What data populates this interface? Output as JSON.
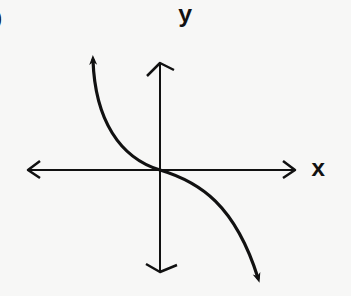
{
  "diagram": {
    "partial_label": ")",
    "axes": {
      "x_label": "x",
      "y_label": "y",
      "origin": [
        160,
        170
      ],
      "x_axis": {
        "from": [
          28,
          170
        ],
        "to": [
          295,
          170
        ],
        "arrows": [
          "left",
          "right"
        ]
      },
      "y_axis": {
        "from": [
          160,
          62
        ],
        "to": [
          160,
          272
        ],
        "arrows": [
          "up",
          "down"
        ]
      }
    },
    "curve": {
      "description": "decreasing cubic-like curve through origin (y = -x^3 shape)",
      "arrows": [
        "upper-left",
        "lower-right"
      ],
      "path": "M 93 60 C 95 120, 120 158, 160 170 C 200 182, 235 205, 258 278"
    },
    "colors": {
      "background": "#f7f7f6",
      "ink": "#111111"
    }
  }
}
